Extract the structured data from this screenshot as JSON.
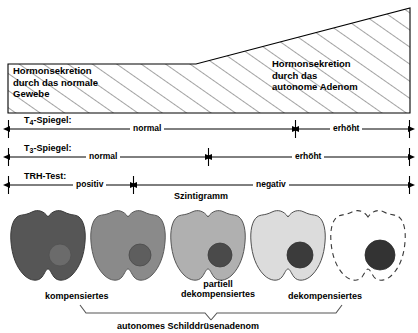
{
  "wedge": {
    "left_label_lines": [
      "Hormonsekretion",
      "durch das normale",
      "Gewebe"
    ],
    "right_label_lines": [
      "Hormonsekretion",
      "durch das",
      "autonome Adenom"
    ]
  },
  "scales": [
    {
      "id": "t4",
      "name_main": "T",
      "name_sub": "4",
      "name_tail": "-Spiegel:",
      "segments": [
        {
          "label": "normal"
        },
        {
          "label": "erhöht"
        }
      ]
    },
    {
      "id": "t3",
      "name_main": "T",
      "name_sub": "3",
      "name_tail": "-Spiegel:",
      "segments": [
        {
          "label": "normal"
        },
        {
          "label": "erhöht"
        }
      ]
    },
    {
      "id": "trh",
      "name_main": "TRH-Test:",
      "name_sub": "",
      "name_tail": "",
      "segments": [
        {
          "label": "positiv"
        },
        {
          "label": "negativ"
        }
      ]
    }
  ],
  "scintigram": {
    "title": "Szintigramm",
    "glands": [
      {
        "fill": "#565656",
        "nodule": "#6b6b6b",
        "dashed": false
      },
      {
        "fill": "#8a8a8a",
        "nodule": "#5e5e5e",
        "dashed": false
      },
      {
        "fill": "#b0b0b0",
        "nodule": "#4a4a4a",
        "dashed": false
      },
      {
        "fill": "#dcdcdc",
        "nodule": "#3b3b3b",
        "dashed": false
      },
      {
        "fill": "#ffffff",
        "nodule": "#333333",
        "dashed": true
      }
    ],
    "captions": [
      {
        "lines": [
          "kompensiertes"
        ]
      },
      {
        "lines": [
          "partiell",
          "dekompensiertes"
        ]
      },
      {
        "lines": [
          "dekompensiertes"
        ]
      }
    ],
    "brace_label": "autonomes Schilddrüsenadenom"
  },
  "colors": {
    "stroke": "#000000",
    "background": "#ffffff",
    "hatch": "#333333"
  }
}
